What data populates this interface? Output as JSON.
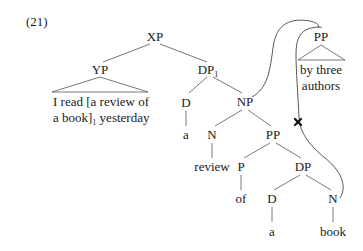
{
  "example_number": "(21)",
  "tree": {
    "root": {
      "label": "XP"
    },
    "yp": {
      "label": "YP",
      "content_line1": "I read [a review of",
      "content_line2": "a book]",
      "content_subscript": "1",
      "content_line2_tail": " yesterday"
    },
    "dp1": {
      "label": "DP",
      "subscript": "1"
    },
    "d1": {
      "label": "D",
      "word": "a"
    },
    "np": {
      "label": "NP"
    },
    "n1": {
      "label": "N",
      "word": "review"
    },
    "pp": {
      "label": "PP"
    },
    "p": {
      "label": "P",
      "word": "of"
    },
    "dp": {
      "label": "DP"
    },
    "d2": {
      "label": "D",
      "word": "a"
    },
    "n2": {
      "label": "N",
      "word": "book"
    }
  },
  "extraposed": {
    "label": "PP",
    "content_line1": "by three",
    "content_line2": "authors"
  },
  "movement": {
    "blocked_marker": "×",
    "description": "PP adjoins to NP; movement from N (book) blocked"
  }
}
